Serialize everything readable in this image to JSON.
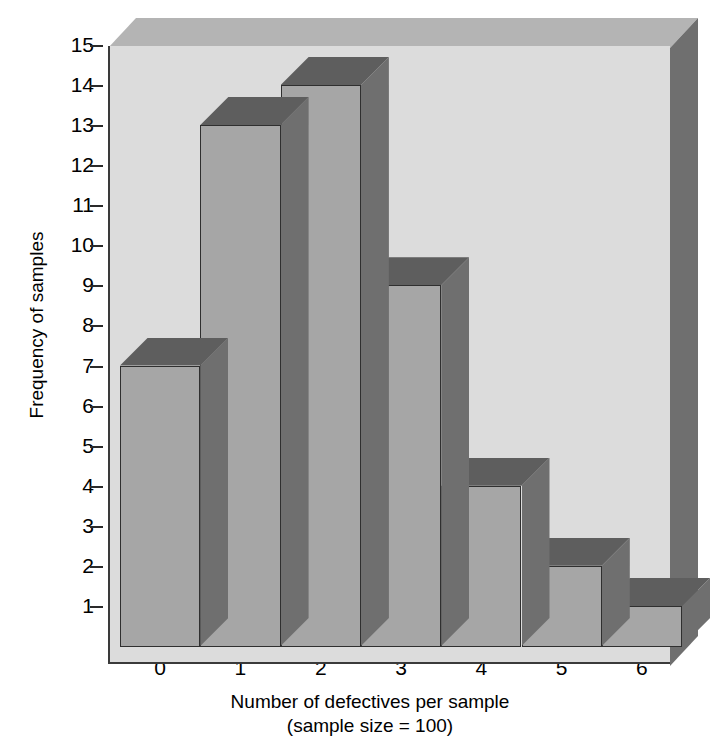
{
  "chart_data": {
    "type": "bar",
    "title": "",
    "subtitle": "",
    "xlabel": "Number of defectives per sample",
    "xlabel_note": "(sample size = 100)",
    "ylabel": "Frequency of samples",
    "categories": [
      "0",
      "1",
      "2",
      "3",
      "4",
      "5",
      "6"
    ],
    "values": [
      7,
      13,
      14,
      9,
      4,
      2,
      1
    ],
    "ylim": [
      0,
      15
    ],
    "y_ticks": [
      "1",
      "2",
      "3",
      "4",
      "5",
      "6",
      "7",
      "8",
      "9",
      "10",
      "11",
      "12",
      "13",
      "14",
      "15"
    ],
    "x_ticks": [
      "0",
      "1",
      "2",
      "3",
      "4",
      "5",
      "6"
    ],
    "grid": false,
    "legend": "none",
    "style": "3d-histogram",
    "colors": {
      "bar_front": "#a6a6a6",
      "bar_top": "#5e5e5e",
      "bar_side": "#6f6f6f",
      "plot_background": "#dcdcdc",
      "box_top": "#b4b4b4",
      "box_right": "#6f6f6f",
      "axis": "#3a3a3a",
      "text": "#000000",
      "page_background": "#ffffff"
    }
  }
}
